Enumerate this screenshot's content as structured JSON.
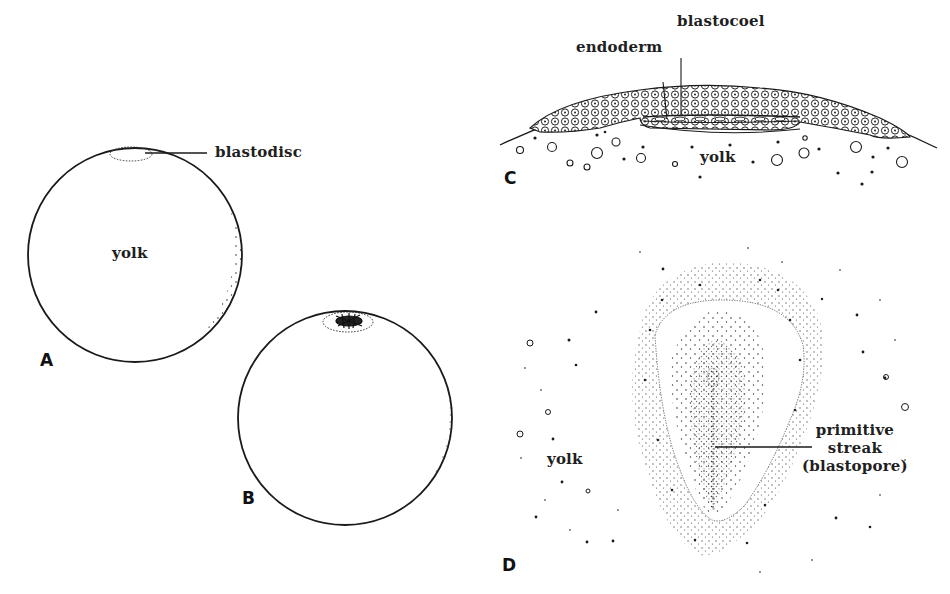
{
  "figure": {
    "panels": [
      {
        "id": "A",
        "letter": "A",
        "labels": {
          "blastodisc": "blastodisc",
          "yolk": "yolk"
        }
      },
      {
        "id": "B",
        "letter": "B",
        "labels": {}
      },
      {
        "id": "C",
        "letter": "C",
        "labels": {
          "endoderm": "endoderm",
          "blastocoel": "blastocoel",
          "yolk": "yolk"
        }
      },
      {
        "id": "D",
        "letter": "D",
        "labels": {
          "yolk": "yolk",
          "primitive_streak_line1": "primitive",
          "primitive_streak_line2": "streak",
          "primitive_streak_line3": "(blastopore)"
        }
      }
    ]
  },
  "colors": {
    "ink": "#1a1a1a",
    "background": "#ffffff",
    "stipple": "#333333"
  }
}
